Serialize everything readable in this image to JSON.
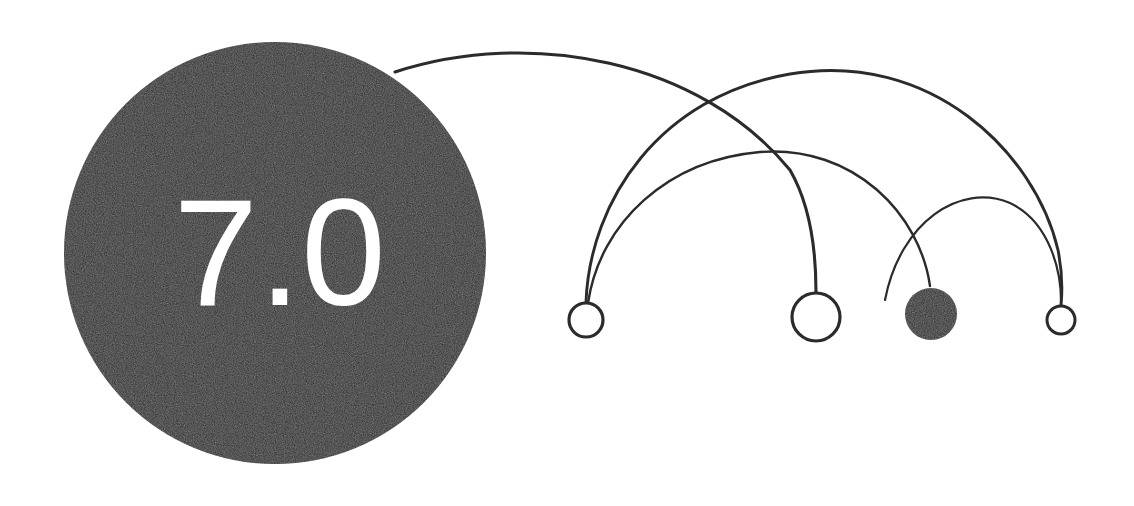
{
  "canvas": {
    "width": 1134,
    "height": 506,
    "background_color": "#ffffff"
  },
  "theme": {
    "ink_color": "#262626",
    "edge_color": "#2b2b2b",
    "label_color": "#ffffff"
  },
  "primary_node": {
    "label": "7.0",
    "cx": 275,
    "cy": 253,
    "r": 211,
    "fill": "#262626",
    "label_color": "#ffffff",
    "label_size": 152,
    "label_x": 280,
    "label_y": 305
  },
  "nodes": [
    {
      "id": "node-1",
      "style": "hollow",
      "cx": 586,
      "cy": 320,
      "r": 17,
      "stroke_width": 3.2,
      "fill": "#ffffff",
      "stroke": "#2b2b2b"
    },
    {
      "id": "node-2",
      "style": "hollow",
      "cx": 816,
      "cy": 317,
      "r": 24,
      "stroke_width": 3.2,
      "fill": "#ffffff",
      "stroke": "#2b2b2b"
    },
    {
      "id": "node-3",
      "style": "filled",
      "cx": 931,
      "cy": 314,
      "r": 26,
      "stroke_width": 0,
      "fill": "#262626",
      "stroke": "#262626"
    },
    {
      "id": "node-4",
      "style": "hollow",
      "cx": 1061,
      "cy": 320,
      "r": 14,
      "stroke_width": 3.0,
      "fill": "#ffffff",
      "stroke": "#2b2b2b"
    }
  ],
  "edges": [
    {
      "id": "edge-hub-to-node-2",
      "from": "primary-node",
      "to": "node-2",
      "path": "M 395 72 C 530 28 700 60 790 170 C 812 208 816 258 816 292",
      "stroke_width": 3.1,
      "stroke": "#2b2b2b"
    },
    {
      "id": "edge-node-1-to-node-4",
      "from": "node-1",
      "to": "node-4",
      "path": "M 586 302 C 590 200 660 96 790 74 C 930 50 1035 152 1058 250 C 1063 275 1062 295 1061 305",
      "stroke_width": 2.9,
      "stroke": "#2b2b2b"
    },
    {
      "id": "edge-node-1-to-node-3",
      "from": "node-1",
      "to": "node-3",
      "path": "M 588 303 C 600 222 668 160 760 152 C 855 145 920 215 930 286",
      "stroke_width": 2.4,
      "stroke": "#2b2b2b"
    },
    {
      "id": "edge-node-3-to-node-4",
      "from": "node-3",
      "to": "node-4",
      "path": "M 885 300 C 900 222 960 182 1010 203 C 1050 222 1062 272 1061 306",
      "stroke_width": 2.2,
      "stroke": "#2b2b2b"
    }
  ],
  "chart_data": {
    "type": "diagram",
    "title": "7.0",
    "node_count": 5,
    "edge_count": 4,
    "hub_label": "7.0"
  }
}
